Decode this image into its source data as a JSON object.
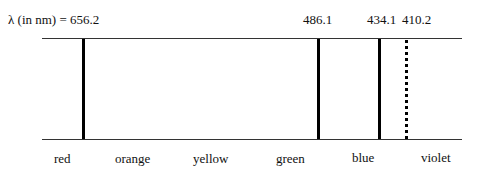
{
  "diagram": {
    "title_prefix": "λ (in nm) = ",
    "lines": [
      {
        "wavelength": "656.2",
        "x": 82,
        "style": "solid"
      },
      {
        "wavelength": "486.1",
        "x": 317,
        "style": "solid"
      },
      {
        "wavelength": "434.1",
        "x": 378,
        "style": "solid"
      },
      {
        "wavelength": "410.2",
        "x": 405,
        "style": "dotted"
      }
    ],
    "top_labels": {
      "first": "λ (in nm) = 656.2",
      "second": "486.1",
      "third": "434.1",
      "fourth": "410.2"
    },
    "colors": [
      "red",
      "orange",
      "yellow",
      "green",
      "blue",
      "violet"
    ]
  }
}
